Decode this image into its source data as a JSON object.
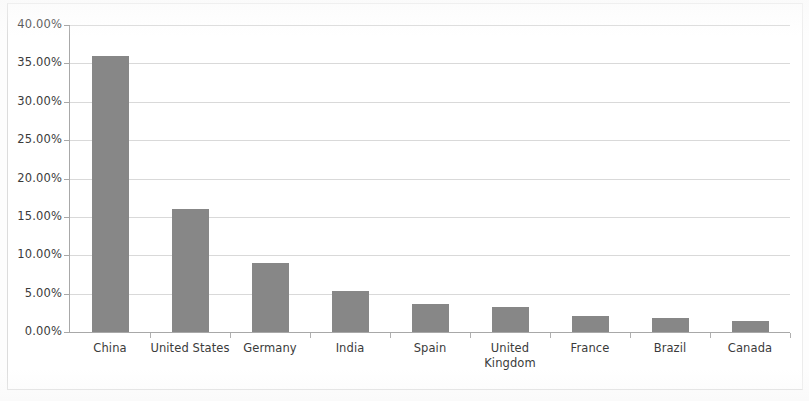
{
  "chart_data": {
    "type": "bar",
    "title": "",
    "subtitle": "",
    "xlabel": "",
    "ylabel": "",
    "categories": [
      "China",
      "United States",
      "Germany",
      "India",
      "Spain",
      "United Kingdom",
      "France",
      "Brazil",
      "Canada"
    ],
    "values": [
      36.0,
      16.0,
      9.0,
      5.4,
      3.7,
      3.2,
      2.1,
      1.8,
      1.5
    ],
    "value_labels": [
      "36.00%",
      "16.00%",
      "9.00%",
      "5.40%",
      "3.70%",
      "3.20%",
      "2.10%",
      "1.80%",
      "1.50%"
    ],
    "ylim": [
      0,
      40
    ],
    "ytick_values": [
      0,
      5,
      10,
      15,
      20,
      25,
      30,
      35,
      40
    ],
    "ytick_labels": [
      "0.00%",
      "5.00%",
      "10.00%",
      "15.00%",
      "20.00%",
      "25.00%",
      "30.00%",
      "35.00%",
      "40.00%"
    ],
    "grid": true,
    "grid_axis": "y",
    "legend": false,
    "legend_position": "none",
    "series": [
      {
        "name": "",
        "values": [
          36.0,
          16.0,
          9.0,
          5.4,
          3.7,
          3.2,
          2.1,
          1.8,
          1.5
        ]
      }
    ]
  },
  "style": {
    "bar_color": "#878787",
    "grid_color": "#d2d2d2",
    "axis_color": "#a8a8a8",
    "text_color": "#3b3b3b",
    "background": "#ffffff"
  }
}
